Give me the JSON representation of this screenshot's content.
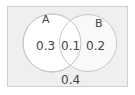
{
  "diagram": {
    "type": "venn",
    "universe": {
      "background": "#efefef",
      "border": "#cfcfcf"
    },
    "sets": [
      {
        "name": "A",
        "only_value": "0.3"
      },
      {
        "name": "B",
        "only_value": "0.2"
      }
    ],
    "intersection_value": "0.1",
    "outside_value": "0.4",
    "circle_fill": "#ffffff",
    "circle_stroke": "#c8c8c8"
  }
}
